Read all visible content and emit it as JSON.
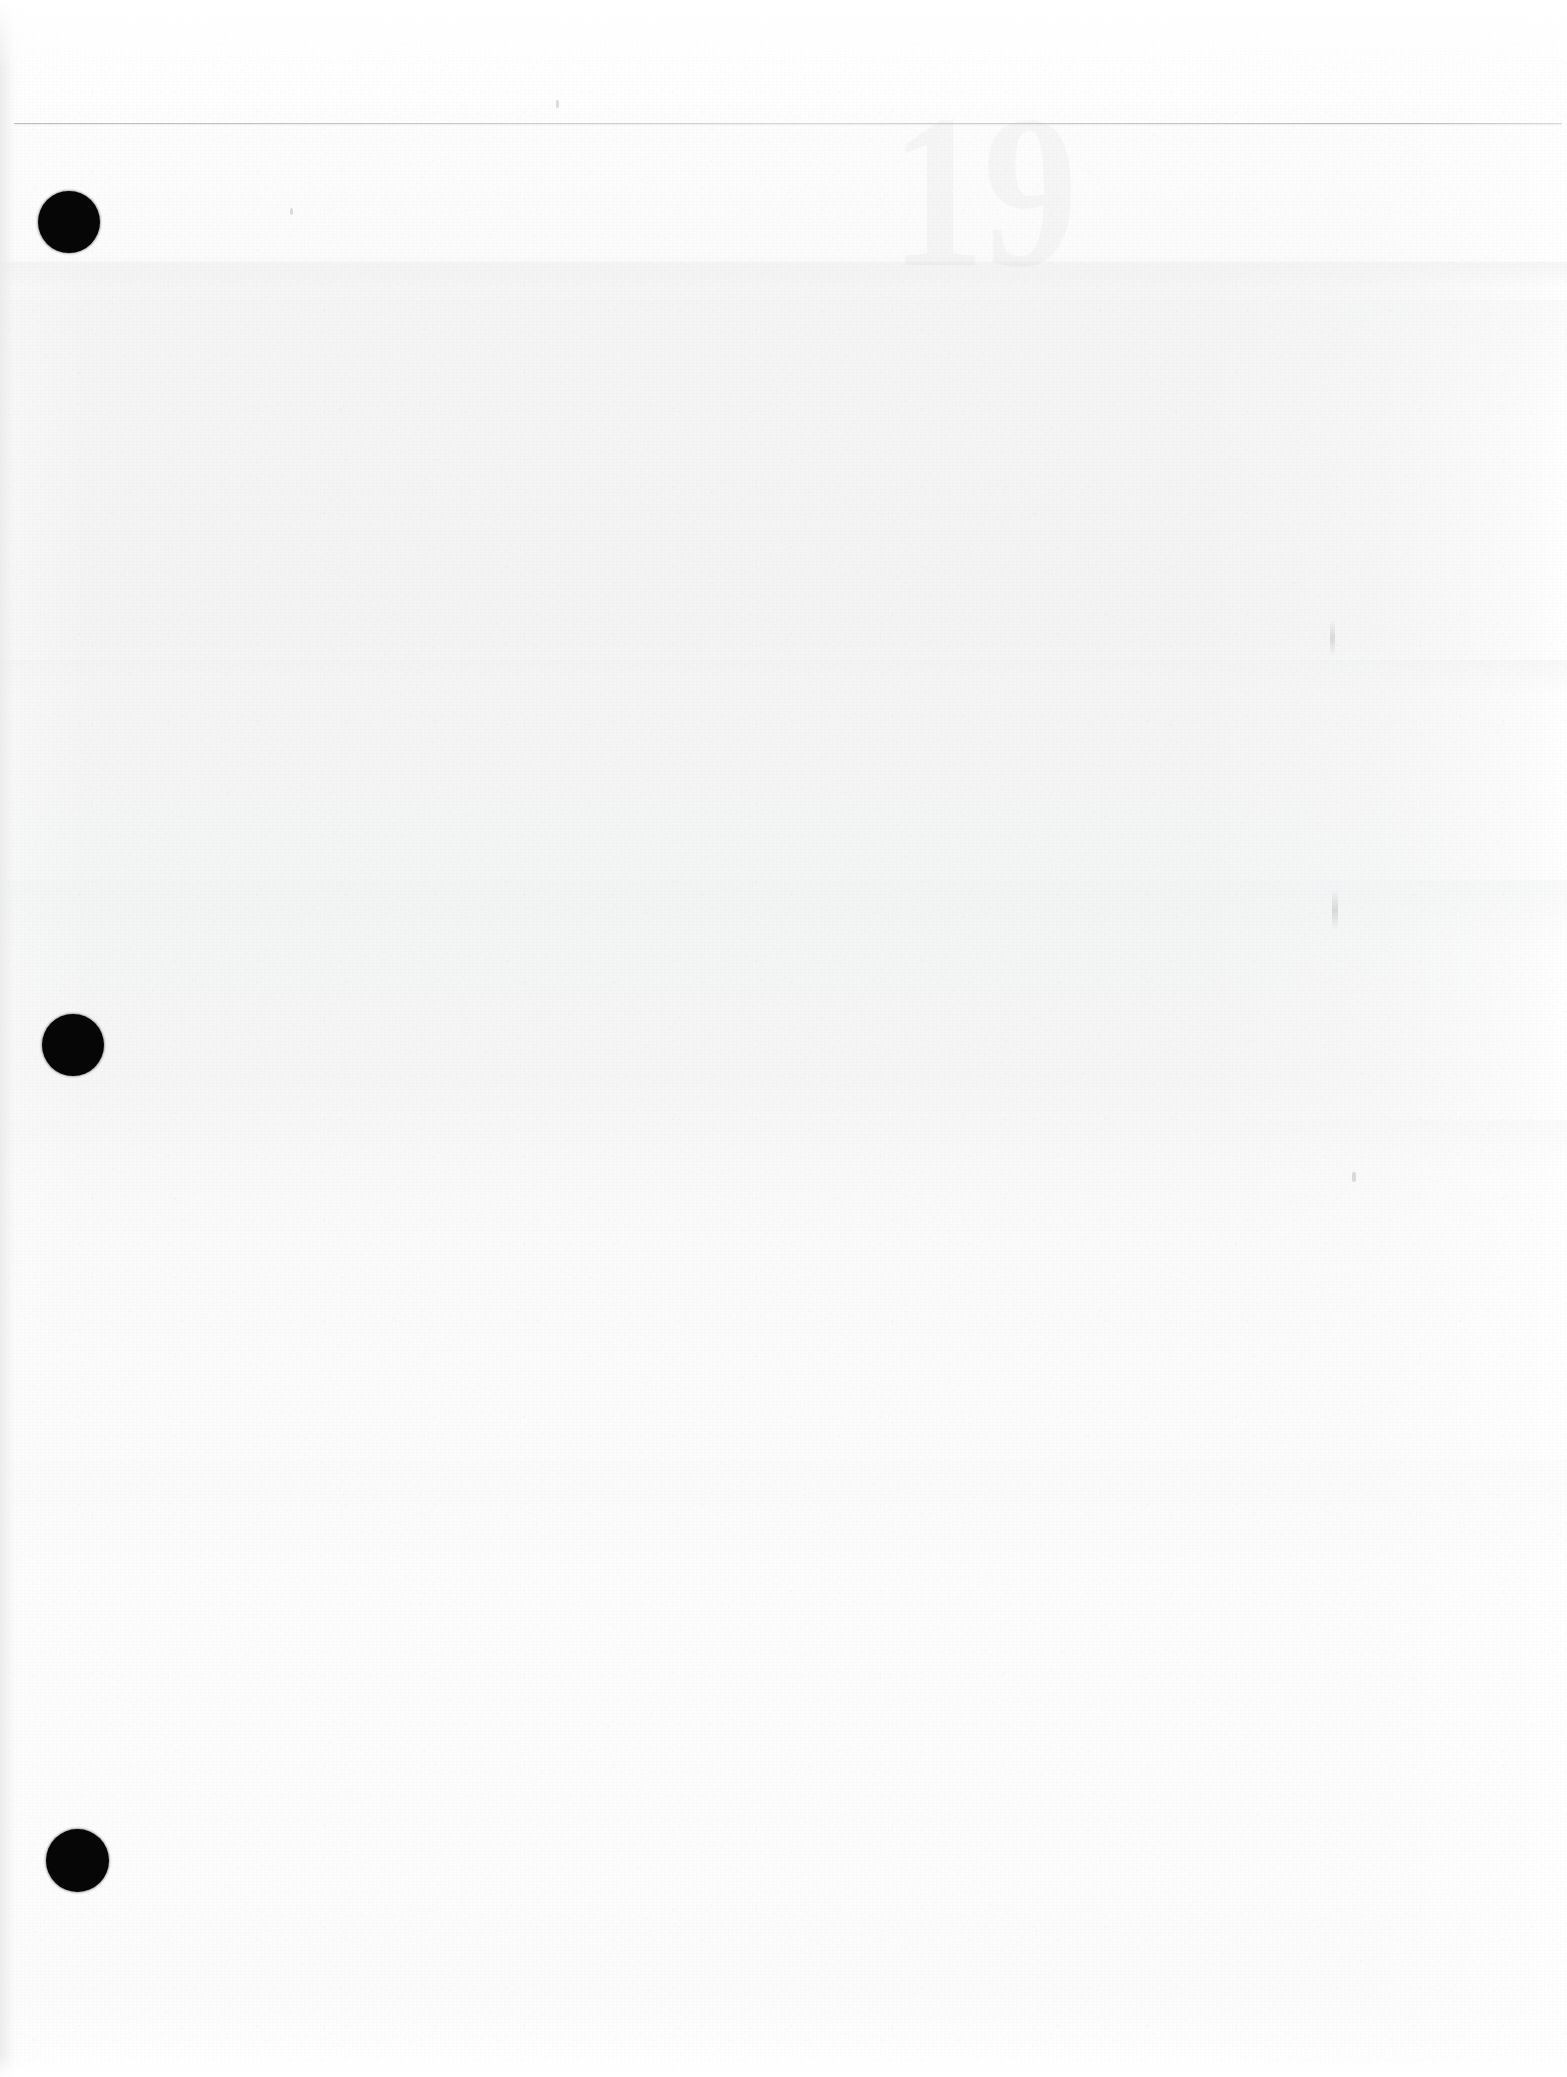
{
  "document": {
    "type": "scanned-page",
    "kind": "blank-verso",
    "page_width": 1567,
    "page_height": 2077,
    "paper_color": "#fdfdfd",
    "visible_text": "",
    "notes_text": ""
  },
  "artifacts": {
    "rule": {
      "name": "horizontal-rule",
      "color": "#b4b6ba",
      "y": 123,
      "x_start": 14,
      "x_end": 1562,
      "thickness": 1
    },
    "punch_holes": [
      {
        "label": "punch-hole-top",
        "cx": 69,
        "cy": 222,
        "d": 62,
        "color": "#060606"
      },
      {
        "label": "punch-hole-middle",
        "cx": 73,
        "cy": 1045,
        "d": 62,
        "color": "#060606"
      },
      {
        "label": "punch-hole-bottom",
        "cx": 77,
        "cy": 1860,
        "d": 63,
        "color": "#060606"
      }
    ],
    "bleed_through": [
      {
        "label": "ghost-numeral",
        "text": "19",
        "x": 890,
        "y": 96,
        "size": 190,
        "opacity": 0.028
      }
    ],
    "stray_marks": [
      {
        "label": "smudge-right-upper",
        "x": 1330,
        "y": 620,
        "w": 5,
        "h": 36
      },
      {
        "label": "smudge-right-lower",
        "x": 1332,
        "y": 890,
        "w": 6,
        "h": 40
      },
      {
        "label": "fleck-right-mid",
        "x": 1352,
        "y": 1172,
        "w": 4,
        "h": 10
      },
      {
        "label": "fleck-left-upper",
        "x": 290,
        "y": 208,
        "w": 3,
        "h": 7
      },
      {
        "label": "fleck-center",
        "x": 556,
        "y": 100,
        "w": 3,
        "h": 8
      }
    ],
    "tone_bands": [
      {
        "label": "band-upper-edge",
        "y": 262,
        "h": 26
      },
      {
        "label": "band-upper-body",
        "y": 300,
        "h": 120
      },
      {
        "label": "band-mid-seam",
        "y": 660,
        "h": 34
      },
      {
        "label": "band-mid-lower",
        "y": 880,
        "h": 70
      },
      {
        "label": "band-lower-edge",
        "y": 1120,
        "h": 50
      },
      {
        "label": "band-bottom-fade",
        "y": 1460,
        "h": 120
      }
    ]
  }
}
